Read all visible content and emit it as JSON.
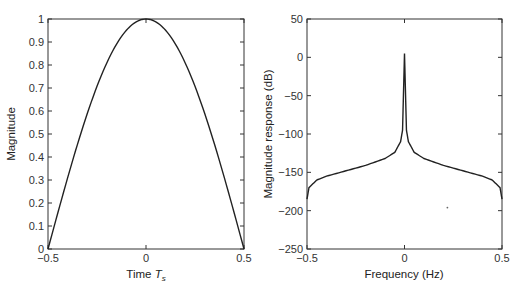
{
  "chart_data": [
    {
      "type": "line",
      "title": "",
      "xlabel": "Time T_s",
      "xlabel_main": "Time ",
      "xlabel_sym": "T",
      "xlabel_sub": "s",
      "ylabel": "Magnitude",
      "xlim": [
        -0.5,
        0.5
      ],
      "ylim": [
        0,
        1
      ],
      "xticks": [
        "−0.5",
        "0",
        "0.5"
      ],
      "yticks": [
        "0",
        "0.1",
        "0.2",
        "0.3",
        "0.4",
        "0.5",
        "0.6",
        "0.7",
        "0.8",
        "0.9",
        "1"
      ],
      "grid": false,
      "series": [
        {
          "name": "cosine pulse",
          "x": [
            -0.5,
            -0.4,
            -0.3,
            -0.2,
            -0.1,
            0,
            0.1,
            0.2,
            0.3,
            0.4,
            0.5
          ],
          "values": [
            0.0,
            0.31,
            0.59,
            0.81,
            0.95,
            1.0,
            0.95,
            0.81,
            0.59,
            0.31,
            0.0
          ]
        }
      ]
    },
    {
      "type": "line",
      "title": "",
      "xlabel": "Frequency (Hz)",
      "ylabel": "Magnitude response (dB)",
      "xlim": [
        -0.5,
        0.5
      ],
      "ylim": [
        -250,
        50
      ],
      "xticks": [
        "−0.5",
        "0",
        "0.5"
      ],
      "yticks": [
        "−250",
        "−200",
        "−150",
        "−100",
        "−50",
        "0",
        "50"
      ],
      "grid": false,
      "series": [
        {
          "name": "spectrum",
          "x": [
            -0.5,
            -0.49,
            -0.45,
            -0.4,
            -0.3,
            -0.2,
            -0.1,
            -0.05,
            -0.02,
            -0.01,
            0,
            0.01,
            0.02,
            0.05,
            0.1,
            0.2,
            0.3,
            0.4,
            0.45,
            0.49,
            0.5
          ],
          "values": [
            -185,
            -170,
            -160,
            -155,
            -148,
            -141,
            -132,
            -124,
            -110,
            -95,
            5,
            -95,
            -110,
            -124,
            -132,
            -141,
            -148,
            -155,
            -160,
            -170,
            -185
          ]
        }
      ],
      "annotations": [
        {
          "type": "dot",
          "x": 0.22,
          "y": -196
        }
      ]
    }
  ]
}
